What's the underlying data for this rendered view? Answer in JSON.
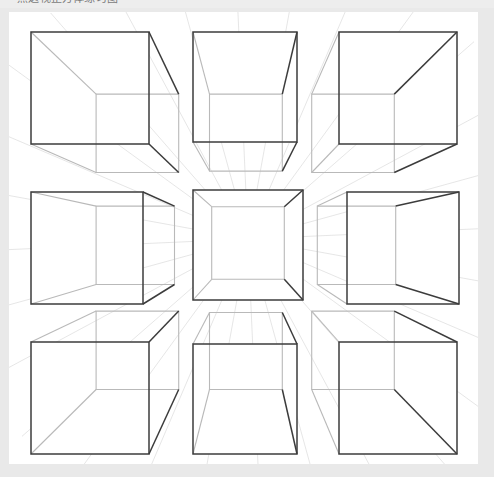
{
  "page": {
    "clipped_top_text": "一点透视正方体练习图",
    "background_color": "#e9e9e9",
    "card_color": "#ffffff",
    "line_color_strong": "#3c3c3c",
    "line_color_hidden": "#b9b9b9",
    "ray_color": "#e0e0e0"
  },
  "chart_data": {
    "type": "diagram",
    "subtitle": "Nine cubes arranged around a single central vanishing point",
    "view_box": {
      "width": 469,
      "height": 452
    },
    "vanishing_point": {
      "x": 239,
      "y": 227,
      "label": "VP"
    },
    "grid": {
      "rows": 3,
      "cols": 3,
      "count": 9
    },
    "ray_count": 28,
    "ray_length": 300,
    "cubes": [
      {
        "id": "cube-top-left",
        "position": "top-left",
        "row": 0,
        "col": 0,
        "face": {
          "x": 22,
          "y": 20,
          "w": 118,
          "h": 112
        },
        "depth": 0.3,
        "visible_faces": [
          "front",
          "right",
          "bottom"
        ],
        "note": "front plane upper-left of VP; recedes down-right"
      },
      {
        "id": "cube-top-middle",
        "position": "top-middle",
        "row": 0,
        "col": 1,
        "face": {
          "x": 184,
          "y": 20,
          "w": 104,
          "h": 110
        },
        "depth": 0.3,
        "visible_faces": [
          "front",
          "bottom"
        ],
        "note": "front plane directly above VP; recedes straight down"
      },
      {
        "id": "cube-top-right",
        "position": "top-right",
        "row": 0,
        "col": 2,
        "face": {
          "x": 330,
          "y": 20,
          "w": 118,
          "h": 112
        },
        "depth": 0.3,
        "visible_faces": [
          "front",
          "left",
          "bottom"
        ],
        "note": "front plane upper-right of VP; recedes down-left"
      },
      {
        "id": "cube-middle-left",
        "position": "middle-left",
        "row": 1,
        "col": 0,
        "face": {
          "x": 22,
          "y": 180,
          "w": 112,
          "h": 112
        },
        "depth": 0.3,
        "visible_faces": [
          "front",
          "right"
        ],
        "note": "front plane left of VP; recedes right only"
      },
      {
        "id": "cube-center",
        "position": "center",
        "row": 1,
        "col": 1,
        "face": {
          "x": 184,
          "y": 178,
          "w": 110,
          "h": 110
        },
        "depth": 0.34,
        "visible_faces": [
          "front",
          "interior"
        ],
        "note": "VP sits inside the face; all four inner faces visible"
      },
      {
        "id": "cube-middle-right",
        "position": "middle-right",
        "row": 1,
        "col": 2,
        "face": {
          "x": 338,
          "y": 180,
          "w": 112,
          "h": 112
        },
        "depth": 0.3,
        "visible_faces": [
          "front",
          "left"
        ],
        "note": "front plane right of VP; recedes left only"
      },
      {
        "id": "cube-bottom-left",
        "position": "bottom-left",
        "row": 2,
        "col": 0,
        "face": {
          "x": 22,
          "y": 330,
          "w": 118,
          "h": 112
        },
        "depth": 0.3,
        "visible_faces": [
          "front",
          "right",
          "top"
        ],
        "note": "front plane lower-left of VP; recedes up-right"
      },
      {
        "id": "cube-bottom-middle",
        "position": "bottom-middle",
        "row": 2,
        "col": 1,
        "face": {
          "x": 184,
          "y": 332,
          "w": 104,
          "h": 110
        },
        "depth": 0.3,
        "visible_faces": [
          "front",
          "top"
        ],
        "note": "front plane directly below VP; recedes straight up"
      },
      {
        "id": "cube-bottom-right",
        "position": "bottom-right",
        "row": 2,
        "col": 2,
        "face": {
          "x": 330,
          "y": 330,
          "w": 118,
          "h": 112
        },
        "depth": 0.3,
        "visible_faces": [
          "front",
          "left",
          "top"
        ],
        "note": "front plane lower-right of VP; recedes up-left"
      }
    ]
  }
}
